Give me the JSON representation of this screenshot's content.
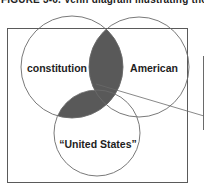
{
  "figure": {
    "caption": "FIGURE 3-6. Venn diagram illustrating the use"
  },
  "venn": {
    "sets": [
      {
        "id": "constitution",
        "label": "constitution"
      },
      {
        "id": "american",
        "label": "American"
      },
      {
        "id": "united_states",
        "label": "“United States”"
      }
    ],
    "shaded_intersections": [
      [
        "constitution",
        "american"
      ],
      [
        "constitution",
        "united_states"
      ]
    ],
    "colors": {
      "outline": "#6a6a6a",
      "frame": "#5a5a5a",
      "shade": "#595959",
      "text": "#1e1e1e"
    }
  }
}
